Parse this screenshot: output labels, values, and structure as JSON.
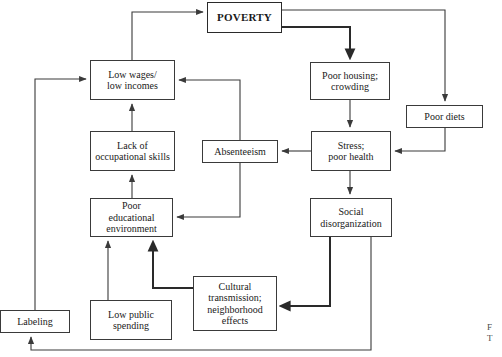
{
  "figure": {
    "type": "flow-diagram",
    "title_node": "POVERTY",
    "background_color": "#ffffff",
    "line_color": "#3a3a3a",
    "text_color": "#1a1a1a",
    "caption_fragment": "F\nT"
  },
  "nodes": [
    {
      "id": "poverty",
      "label": "POVERTY",
      "x": 207,
      "y": 2,
      "w": 75,
      "h": 31,
      "font_size": 11,
      "bold": true
    },
    {
      "id": "low-wages",
      "label": "Low wages/\nlow incomes",
      "x": 90,
      "y": 60,
      "w": 85,
      "h": 40,
      "font_size": 10,
      "bold": false
    },
    {
      "id": "poor-housing",
      "label": "Poor housing;\ncrowding",
      "x": 310,
      "y": 62,
      "w": 80,
      "h": 38,
      "font_size": 10,
      "bold": false
    },
    {
      "id": "poor-diets",
      "label": "Poor diets",
      "x": 406,
      "y": 105,
      "w": 77,
      "h": 23,
      "font_size": 10,
      "bold": false
    },
    {
      "id": "lack-skills",
      "label": "Lack of\noccupational skills",
      "x": 90,
      "y": 131,
      "w": 85,
      "h": 40,
      "font_size": 10,
      "bold": false
    },
    {
      "id": "absenteeism",
      "label": "Absenteeism",
      "x": 202,
      "y": 140,
      "w": 76,
      "h": 23,
      "font_size": 10,
      "bold": false
    },
    {
      "id": "stress",
      "label": "Stress;\npoor health",
      "x": 311,
      "y": 131,
      "w": 80,
      "h": 40,
      "font_size": 10,
      "bold": false
    },
    {
      "id": "poor-edu",
      "label": "Poor\neducational\nenvironment",
      "x": 90,
      "y": 198,
      "w": 83,
      "h": 39,
      "font_size": 10,
      "bold": false
    },
    {
      "id": "social-dis",
      "label": "Social\ndisorganization",
      "x": 310,
      "y": 198,
      "w": 82,
      "h": 39,
      "font_size": 10,
      "bold": false
    },
    {
      "id": "cultural",
      "label": "Cultural\ntransmission;\nneighborhood\neffects",
      "x": 193,
      "y": 276,
      "w": 84,
      "h": 55,
      "font_size": 10,
      "bold": false
    },
    {
      "id": "low-public",
      "label": "Low public\nspending",
      "x": 90,
      "y": 300,
      "w": 82,
      "h": 40,
      "font_size": 10,
      "bold": false
    },
    {
      "id": "labeling",
      "label": "Labeling",
      "x": 0,
      "y": 310,
      "w": 70,
      "h": 23,
      "font_size": 10,
      "bold": false
    }
  ],
  "edges": [
    {
      "id": "low-wages-to-poverty",
      "from": "low-wages",
      "to": "poverty",
      "thick": false
    },
    {
      "id": "poverty-to-poor-housing",
      "from": "poverty",
      "to": "poor-housing",
      "thick": true
    },
    {
      "id": "poverty-to-poor-diets",
      "from": "poverty",
      "to": "poor-diets",
      "thick": false
    },
    {
      "id": "poor-housing-to-stress",
      "from": "poor-housing",
      "to": "stress",
      "thick": false
    },
    {
      "id": "poor-diets-to-stress",
      "from": "poor-diets",
      "to": "stress",
      "thick": false
    },
    {
      "id": "stress-to-absenteeism",
      "from": "stress",
      "to": "absenteeism",
      "thick": false
    },
    {
      "id": "stress-to-social-dis",
      "from": "stress",
      "to": "social-dis",
      "thick": false
    },
    {
      "id": "absenteeism-to-low-wages",
      "from": "absenteeism",
      "to": "low-wages",
      "thick": false
    },
    {
      "id": "absenteeism-to-poor-edu",
      "from": "absenteeism",
      "to": "poor-edu",
      "thick": false
    },
    {
      "id": "lack-skills-to-low-wages",
      "from": "lack-skills",
      "to": "low-wages",
      "thick": false
    },
    {
      "id": "poor-edu-to-lack-skills",
      "from": "poor-edu",
      "to": "lack-skills",
      "thick": false
    },
    {
      "id": "low-public-to-poor-edu",
      "from": "low-public",
      "to": "poor-edu",
      "thick": false
    },
    {
      "id": "cultural-to-poor-edu",
      "from": "cultural",
      "to": "poor-edu",
      "thick": true
    },
    {
      "id": "social-dis-to-cultural",
      "from": "social-dis",
      "to": "cultural",
      "thick": true
    },
    {
      "id": "social-dis-to-labeling",
      "from": "social-dis",
      "to": "labeling",
      "thick": false
    },
    {
      "id": "labeling-to-low-wages",
      "from": "labeling",
      "to": "low-wages",
      "thick": false
    }
  ]
}
